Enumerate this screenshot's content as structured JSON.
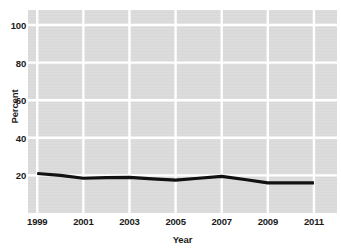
{
  "chart_data": {
    "type": "line",
    "title": "",
    "xlabel": "Year",
    "ylabel": "Percent",
    "x": [
      1999,
      2000,
      2001,
      2002,
      2003,
      2004,
      2005,
      2006,
      2007,
      2008,
      2009,
      2010,
      2011
    ],
    "values": [
      21,
      20,
      18.5,
      18.8,
      19,
      18.2,
      17.5,
      18.5,
      19.5,
      17.8,
      16,
      16,
      16
    ],
    "series": [
      {
        "name": "Percent",
        "values": [
          21,
          20,
          18.5,
          18.8,
          19,
          18.2,
          17.5,
          18.5,
          19.5,
          17.8,
          16,
          16,
          16
        ]
      }
    ],
    "xlim": [
      1998.6,
      2012.0
    ],
    "ylim": [
      0,
      108
    ],
    "xticks": [
      1999,
      2001,
      2003,
      2005,
      2007,
      2009,
      2011
    ],
    "xtick_labels": [
      "1999",
      "2001",
      "2003",
      "2005",
      "2007",
      "2009",
      "2011"
    ],
    "yticks": [
      20,
      40,
      60,
      80,
      100
    ],
    "ytick_labels": [
      "20",
      "40",
      "60",
      "80",
      "100"
    ],
    "grid": true,
    "grid_color": "#ffffff",
    "plot_background": "#dcdcdc",
    "page_background": "#ffffff",
    "line_color": "#111111",
    "line_width": 3.2,
    "legend": "none",
    "markers": "none"
  },
  "geometry": {
    "plot_left": 28,
    "plot_right": 337,
    "plot_top": 10,
    "plot_bottom": 213
  }
}
